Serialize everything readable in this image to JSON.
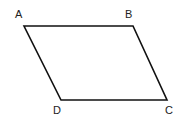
{
  "diagram": {
    "type": "parallelogram",
    "stroke_color": "#111111",
    "stroke_width": 1.6,
    "vertices": [
      {
        "name": "A",
        "x": 24,
        "y": 26,
        "label_x": 15,
        "label_y": 18
      },
      {
        "name": "B",
        "x": 133,
        "y": 26,
        "label_x": 125,
        "label_y": 18
      },
      {
        "name": "C",
        "x": 167,
        "y": 100,
        "label_x": 165,
        "label_y": 114
      },
      {
        "name": "D",
        "x": 61,
        "y": 100,
        "label_x": 53,
        "label_y": 114
      }
    ],
    "labels": {
      "a": "A",
      "b": "B",
      "c": "C",
      "d": "D"
    }
  }
}
